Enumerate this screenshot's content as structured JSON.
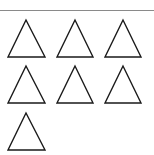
{
  "figure": {
    "shape": "triangle-outline",
    "count": 7,
    "rows": [
      3,
      3,
      1
    ],
    "stroke_color": "#1a1a1a",
    "rule_color": "#8a8a8a",
    "background": "#ffffff",
    "triangles": [
      {
        "row": 1,
        "col": 1
      },
      {
        "row": 1,
        "col": 2
      },
      {
        "row": 1,
        "col": 3
      },
      {
        "row": 2,
        "col": 1
      },
      {
        "row": 2,
        "col": 2
      },
      {
        "row": 2,
        "col": 3
      },
      {
        "row": 3,
        "col": 1
      }
    ]
  }
}
